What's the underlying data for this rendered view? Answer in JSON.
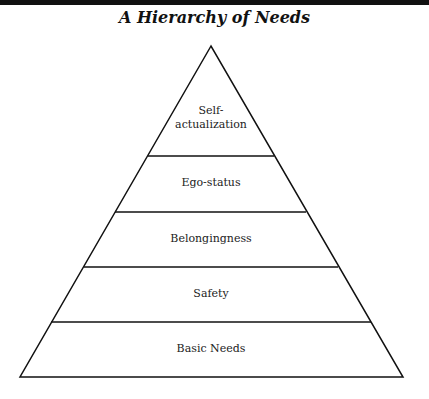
{
  "title": "A Hierarchy of Needs",
  "levels": [
    {
      "label": "Self-\nactualization",
      "line1": "Self-",
      "line2": "actualization"
    },
    {
      "label": "Ego-status"
    },
    {
      "label": "Belongingness"
    },
    {
      "label": "Safety"
    },
    {
      "label": "Basic Needs"
    }
  ]
}
